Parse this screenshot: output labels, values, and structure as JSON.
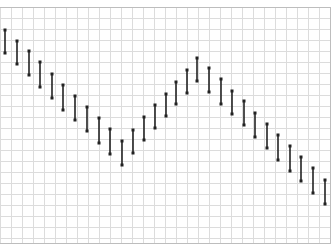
{
  "chart_data": {
    "type": "range-bar",
    "title": "",
    "xlabel": "",
    "ylabel": "",
    "grid": true,
    "legend": null,
    "note": "Values are pixel-space y coordinates (top of bar = high, bottom = low); no axis tick labels are shown.",
    "x": [
      5,
      17,
      29,
      40,
      52,
      63,
      75,
      87,
      99,
      110,
      122,
      133,
      144,
      155,
      166,
      176,
      187,
      197,
      209,
      221,
      232,
      244,
      255,
      267,
      278,
      290,
      301,
      313,
      325
    ],
    "series": [
      {
        "name": "high",
        "values": [
          30,
          41,
          51,
          62,
          74,
          85,
          96,
          107,
          118,
          129,
          141,
          130,
          117,
          105,
          94,
          82,
          70,
          58,
          68,
          79,
          91,
          101,
          113,
          124,
          135,
          146,
          157,
          168,
          180
        ]
      },
      {
        "name": "low",
        "values": [
          53,
          64,
          75,
          87,
          98,
          110,
          120,
          131,
          143,
          154,
          165,
          153,
          140,
          128,
          116,
          104,
          93,
          81,
          92,
          104,
          114,
          125,
          137,
          148,
          160,
          171,
          181,
          193,
          204
        ]
      }
    ],
    "colors": {
      "bar": "#222222",
      "grid": "#dcdcdc",
      "border": "#bdbdbd",
      "background": "#ffffff"
    }
  },
  "plot_area": {
    "left": 0,
    "top": 7,
    "right": 330,
    "bottom": 243,
    "grid_step": 11
  }
}
